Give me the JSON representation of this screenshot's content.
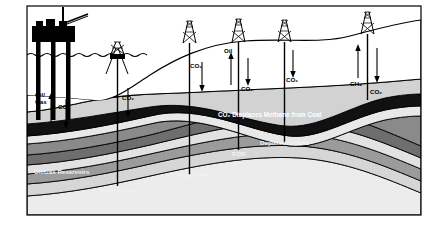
{
  "figure": {
    "frame_color": "#000000",
    "background": "#ffffff"
  },
  "palette": {
    "coal_seam": "#101010",
    "dark_gray_layer": "#5e5e5e",
    "mid_gray_layer": "#8e8e8e",
    "light_gray_layer": "#b8b8b8",
    "pale_layer": "#dcdcdc",
    "lightest_layer": "#ececec",
    "white_layer": "#f4f4f4",
    "structure": "#000000",
    "line": "#000000"
  },
  "structures": {
    "offshore_platform": {
      "name": "offshore-oil-platform",
      "legs": 3
    },
    "derricks": [
      {
        "id": "derrick-offshore-small",
        "label": ""
      },
      {
        "id": "derrick-1",
        "label": ""
      },
      {
        "id": "derrick-2",
        "label": ""
      },
      {
        "id": "derrick-3",
        "label": ""
      },
      {
        "id": "derrick-4",
        "label": ""
      }
    ],
    "sea": {
      "name": "sea-surface",
      "wave_count": 12
    }
  },
  "flow_labels": [
    {
      "id": "flow-oil-gas-up",
      "text": "Oil/",
      "text2": "Gas",
      "direction": "up",
      "x": 40,
      "y": 97
    },
    {
      "id": "flow-co2-down-1",
      "text": "CO₂",
      "direction": "down",
      "x": 62,
      "y": 106
    },
    {
      "id": "flow-co2-down-2",
      "text": "CO₂",
      "direction": "down",
      "x": 127,
      "y": 98
    },
    {
      "id": "flow-co2-down-3",
      "text": "CO₂",
      "direction": "down",
      "x": 193,
      "y": 67
    },
    {
      "id": "flow-oil-up",
      "text": "Oil",
      "direction": "up",
      "x": 227,
      "y": 52
    },
    {
      "id": "flow-co2-down-4",
      "text": "CO₂",
      "direction": "down",
      "x": 244,
      "y": 88
    },
    {
      "id": "flow-co2-down-5",
      "text": "CO₂",
      "direction": "down",
      "x": 290,
      "y": 80
    },
    {
      "id": "flow-ch4-up",
      "text": "CH₄",
      "direction": "up",
      "x": 355,
      "y": 84
    },
    {
      "id": "flow-co2-down-6",
      "text": "CO₂",
      "direction": "down",
      "x": 374,
      "y": 92
    }
  ],
  "strata_labels": [
    {
      "id": "label-co2-displaces-methane",
      "text": "CO₂ Displaces Methane from Coal",
      "style": "on-coal",
      "x": 218,
      "y": 116
    },
    {
      "id": "label-depleted-oil-gas",
      "text": "Depleted Oil/Gas",
      "style": "on-dark",
      "x": 260,
      "y": 144
    },
    {
      "id": "label-eor",
      "text": "EOR",
      "style": "on-dark",
      "x": 232,
      "y": 155
    },
    {
      "id": "label-oil-gas-reservoirs",
      "text": "Oil/Gas Reservoirs",
      "style": "on-dark",
      "x": 34,
      "y": 173
    },
    {
      "id": "label-deep-saline-right",
      "text": "Deep Saline",
      "style": "on-dark",
      "x": 177,
      "y": 176
    },
    {
      "id": "label-deep-saline-left",
      "text": "Deep Saline",
      "style": "on-dark",
      "x": 100,
      "y": 192
    }
  ]
}
